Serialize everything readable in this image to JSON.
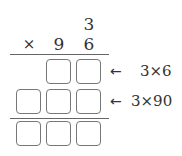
{
  "problem": {
    "carry": "3",
    "operator": "×",
    "multiplier_digits": [
      "9",
      "6"
    ]
  },
  "steps": [
    {
      "arrow": "←",
      "note": "3×6",
      "boxes": 2
    },
    {
      "arrow": "←",
      "note": "3×90",
      "boxes": 3
    }
  ],
  "result": {
    "boxes": 3
  }
}
